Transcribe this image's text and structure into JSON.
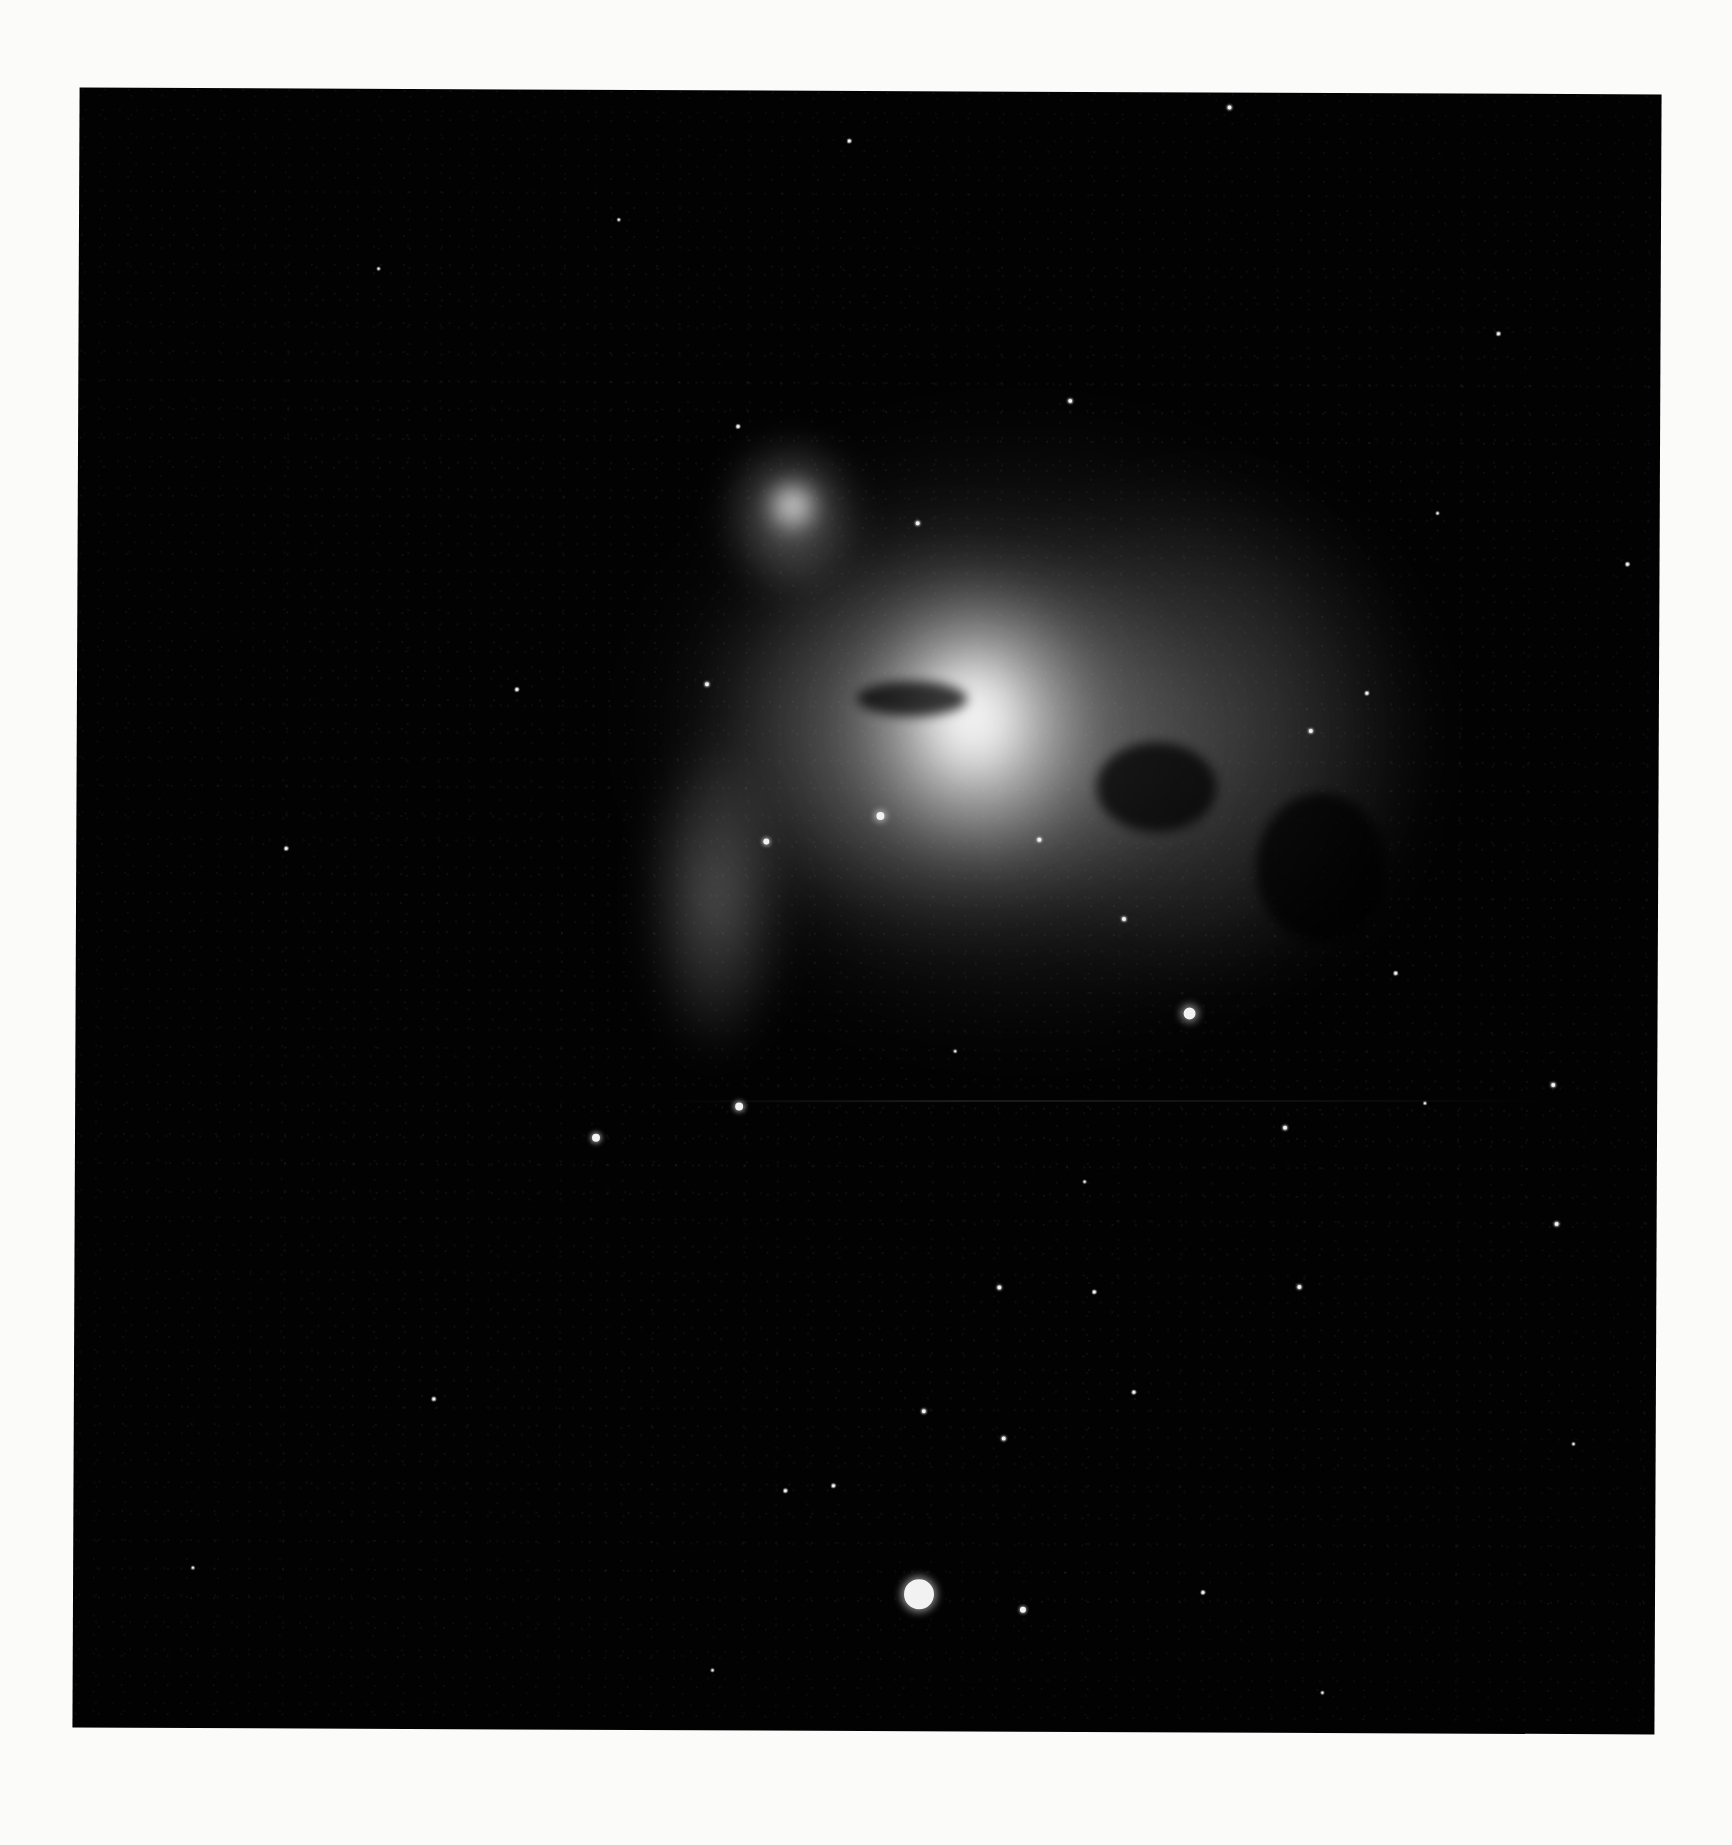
{
  "image": {
    "subject": "Orion Nebula (M42) with De Mairan's Nebula (M43)",
    "style": "black-and-white astrophotograph on white page",
    "page_background": "#fbfbfa",
    "photo_background": "#020202"
  },
  "photo_frame": {
    "left": 76,
    "top": 91,
    "width": 1582,
    "height": 1640,
    "rotation_deg": 0.25
  },
  "nebula_regions": [
    {
      "name": "m42-outer-glow",
      "x": 560,
      "y": 330,
      "w": 760,
      "h": 620,
      "color": "rgba(150,150,150,0.35)",
      "blur": 40
    },
    {
      "name": "m42-right-wing",
      "x": 900,
      "y": 380,
      "w": 460,
      "h": 520,
      "color": "rgba(120,120,120,0.40)",
      "blur": 30
    },
    {
      "name": "m42-mid-body",
      "x": 620,
      "y": 430,
      "w": 520,
      "h": 420,
      "color": "rgba(200,200,200,0.55)",
      "blur": 30
    },
    {
      "name": "m42-lower-left-tendril",
      "x": 565,
      "y": 640,
      "w": 150,
      "h": 330,
      "color": "rgba(170,170,170,0.45)",
      "blur": 18
    },
    {
      "name": "m42-bright-core",
      "x": 780,
      "y": 490,
      "w": 240,
      "h": 280,
      "color": "rgba(255,255,255,0.95)",
      "blur": 30
    },
    {
      "name": "m42-core-hot",
      "x": 840,
      "y": 560,
      "w": 110,
      "h": 130,
      "color": "rgba(255,255,255,1)",
      "blur": 18
    },
    {
      "name": "m43-cloud",
      "x": 638,
      "y": 340,
      "w": 150,
      "h": 170,
      "color": "rgba(170,170,170,0.55)",
      "blur": 14
    },
    {
      "name": "m43-core",
      "x": 685,
      "y": 385,
      "w": 60,
      "h": 60,
      "color": "rgba(245,245,245,0.95)",
      "blur": 10
    }
  ],
  "dark_lanes": [
    {
      "name": "fish-mouth-dust-lane",
      "x": 780,
      "y": 590,
      "w": 110,
      "h": 35
    },
    {
      "name": "right-dark-bay",
      "x": 1180,
      "y": 700,
      "w": 130,
      "h": 150
    },
    {
      "name": "lower-right-dust",
      "x": 1020,
      "y": 650,
      "w": 120,
      "h": 90
    }
  ],
  "stars": [
    {
      "x": 846,
      "y": 1503,
      "r": 15,
      "glow": 8
    },
    {
      "x": 1114,
      "y": 921,
      "r": 6,
      "glow": 8
    },
    {
      "x": 664,
      "y": 1016,
      "r": 4,
      "glow": 5
    },
    {
      "x": 521,
      "y": 1048,
      "r": 4,
      "glow": 5
    },
    {
      "x": 804,
      "y": 725,
      "r": 4,
      "glow": 6
    },
    {
      "x": 690,
      "y": 751,
      "r": 3,
      "glow": 4
    },
    {
      "x": 950,
      "y": 1518,
      "r": 3,
      "glow": 3
    },
    {
      "x": 930,
      "y": 1347,
      "r": 2,
      "glow": 2
    },
    {
      "x": 1150,
      "y": 15,
      "r": 2,
      "glow": 2
    },
    {
      "x": 992,
      "y": 309,
      "r": 2,
      "glow": 2
    },
    {
      "x": 840,
      "y": 432,
      "r": 2,
      "glow": 2
    },
    {
      "x": 630,
      "y": 594,
      "r": 2,
      "glow": 2
    },
    {
      "x": 1048,
      "y": 827,
      "r": 2,
      "glow": 2
    },
    {
      "x": 963,
      "y": 748,
      "r": 2,
      "glow": 2
    },
    {
      "x": 1234,
      "y": 638,
      "r": 2,
      "glow": 2
    },
    {
      "x": 1478,
      "y": 991,
      "r": 2,
      "glow": 2
    },
    {
      "x": 1482,
      "y": 1130,
      "r": 2,
      "glow": 2
    },
    {
      "x": 1210,
      "y": 1035,
      "r": 2,
      "glow": 2
    },
    {
      "x": 925,
      "y": 1196,
      "r": 2,
      "glow": 2
    },
    {
      "x": 1225,
      "y": 1194,
      "r": 2,
      "glow": 2
    },
    {
      "x": 850,
      "y": 1320,
      "r": 2,
      "glow": 2
    },
    {
      "x": 712,
      "y": 1400,
      "r": 1.5,
      "glow": 1
    },
    {
      "x": 1060,
      "y": 1300,
      "r": 1.5,
      "glow": 1
    },
    {
      "x": 440,
      "y": 600,
      "r": 1.5,
      "glow": 1
    },
    {
      "x": 360,
      "y": 1310,
      "r": 1.5,
      "glow": 1
    },
    {
      "x": 1320,
      "y": 880,
      "r": 1.5,
      "glow": 1
    },
    {
      "x": 1290,
      "y": 600,
      "r": 1.5,
      "glow": 1
    },
    {
      "x": 1420,
      "y": 240,
      "r": 1.5,
      "glow": 1
    },
    {
      "x": 660,
      "y": 336,
      "r": 1.5,
      "glow": 1
    },
    {
      "x": 770,
      "y": 50,
      "r": 1.5,
      "glow": 1
    },
    {
      "x": 1020,
      "y": 1200,
      "r": 1.5,
      "glow": 1
    },
    {
      "x": 210,
      "y": 760,
      "r": 1.5,
      "glow": 1
    },
    {
      "x": 1130,
      "y": 1500,
      "r": 1.5,
      "glow": 1
    },
    {
      "x": 760,
      "y": 1395,
      "r": 1.5,
      "glow": 1
    },
    {
      "x": 1550,
      "y": 470,
      "r": 1.5,
      "glow": 1
    },
    {
      "x": 300,
      "y": 180,
      "r": 1.2,
      "glow": 1
    },
    {
      "x": 540,
      "y": 130,
      "r": 1.2,
      "glow": 1
    },
    {
      "x": 1360,
      "y": 420,
      "r": 1.2,
      "glow": 1
    },
    {
      "x": 1500,
      "y": 1350,
      "r": 1.2,
      "glow": 1
    },
    {
      "x": 120,
      "y": 1480,
      "r": 1.2,
      "glow": 1
    },
    {
      "x": 640,
      "y": 1580,
      "r": 1.2,
      "glow": 1
    },
    {
      "x": 1250,
      "y": 1600,
      "r": 1.2,
      "glow": 1
    },
    {
      "x": 1010,
      "y": 1090,
      "r": 1.2,
      "glow": 1
    },
    {
      "x": 880,
      "y": 960,
      "r": 1.2,
      "glow": 1
    },
    {
      "x": 1350,
      "y": 1010,
      "r": 1.2,
      "glow": 1
    }
  ]
}
